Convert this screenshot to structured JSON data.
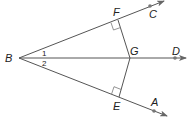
{
  "diagram": {
    "type": "geometry",
    "points": {
      "B": {
        "label": "B",
        "x": 19,
        "y": 58
      },
      "F": {
        "label": "F",
        "x": 118,
        "y": 20
      },
      "C": {
        "label": "C",
        "x": 150,
        "y": 6
      },
      "G": {
        "label": "G",
        "x": 130,
        "y": 58
      },
      "D": {
        "label": "D",
        "x": 175,
        "y": 58
      },
      "E": {
        "label": "E",
        "x": 119,
        "y": 97
      },
      "A": {
        "label": "A",
        "x": 154,
        "y": 111
      }
    },
    "rays": [
      "BC",
      "BD",
      "BA"
    ],
    "segments": [
      "FG",
      "EG"
    ],
    "right_angles": [
      "BFG",
      "BEG"
    ],
    "angles": [
      {
        "label": "1",
        "between": "CBD"
      },
      {
        "label": "2",
        "between": "DBA"
      }
    ],
    "colors": {
      "line": "#555555",
      "point": "#777777"
    }
  }
}
